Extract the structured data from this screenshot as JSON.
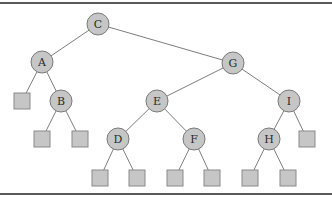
{
  "diagram": {
    "type": "binary-search-tree",
    "nodes": [
      {
        "id": "C",
        "label": "C",
        "x": 98,
        "y": 24
      },
      {
        "id": "A",
        "label": "A",
        "x": 42,
        "y": 62
      },
      {
        "id": "G",
        "label": "G",
        "x": 233,
        "y": 63
      },
      {
        "id": "B",
        "label": "B",
        "x": 61,
        "y": 101
      },
      {
        "id": "E",
        "label": "E",
        "x": 157,
        "y": 101
      },
      {
        "id": "I",
        "label": "I",
        "x": 289,
        "y": 101
      },
      {
        "id": "D",
        "label": "D",
        "x": 118,
        "y": 139
      },
      {
        "id": "F",
        "label": "F",
        "x": 194,
        "y": 139
      },
      {
        "id": "H",
        "label": "H",
        "x": 269,
        "y": 139
      }
    ],
    "leaves": [
      {
        "id": "nA_left",
        "parent": "A",
        "x": 22,
        "y": 101
      },
      {
        "id": "nB_left",
        "parent": "B",
        "x": 42,
        "y": 139
      },
      {
        "id": "nB_right",
        "parent": "B",
        "x": 80,
        "y": 139
      },
      {
        "id": "nD_left",
        "parent": "D",
        "x": 100,
        "y": 178
      },
      {
        "id": "nD_right",
        "parent": "D",
        "x": 137,
        "y": 178
      },
      {
        "id": "nF_left",
        "parent": "F",
        "x": 175,
        "y": 178
      },
      {
        "id": "nF_right",
        "parent": "F",
        "x": 212,
        "y": 178
      },
      {
        "id": "nH_left",
        "parent": "H",
        "x": 250,
        "y": 178
      },
      {
        "id": "nH_right",
        "parent": "H",
        "x": 288,
        "y": 178
      },
      {
        "id": "nI_right",
        "parent": "I",
        "x": 307,
        "y": 139
      }
    ],
    "edges": [
      [
        "C",
        "A"
      ],
      [
        "C",
        "G"
      ],
      [
        "A",
        "nA_left"
      ],
      [
        "A",
        "B"
      ],
      [
        "B",
        "nB_left"
      ],
      [
        "B",
        "nB_right"
      ],
      [
        "G",
        "E"
      ],
      [
        "G",
        "I"
      ],
      [
        "E",
        "D"
      ],
      [
        "E",
        "F"
      ],
      [
        "D",
        "nD_left"
      ],
      [
        "D",
        "nD_right"
      ],
      [
        "F",
        "nF_left"
      ],
      [
        "F",
        "nF_right"
      ],
      [
        "I",
        "H"
      ],
      [
        "I",
        "nI_right"
      ],
      [
        "H",
        "nH_left"
      ],
      [
        "H",
        "nH_right"
      ]
    ],
    "node_radius": 11,
    "leaf_size": 16,
    "colors": {
      "fill": "#c6c6c6",
      "stroke": "#7a7a7a",
      "edge": "#6e6e6e",
      "rule": "#5a5a5a"
    }
  }
}
